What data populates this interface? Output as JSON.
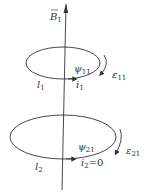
{
  "diagram": {
    "type": "mutual-inductance-coils",
    "colors": {
      "stroke": "#333333",
      "background": "#ffffff"
    },
    "field": {
      "symbol": "B",
      "subscript": "1",
      "overline": true
    },
    "coil1": {
      "length_label": {
        "symbol": "l",
        "subscript": "1"
      },
      "current_label": {
        "symbol": "i",
        "subscript": "1"
      },
      "flux_label": {
        "symbol": "ψ",
        "subscript": "11"
      },
      "emf_label": {
        "symbol": "ε",
        "subscript": "11"
      }
    },
    "coil2": {
      "length_label": {
        "symbol": "l",
        "subscript": "2"
      },
      "current_label": {
        "symbol": "i",
        "subscript": "2",
        "suffix": "=0"
      },
      "flux_label": {
        "symbol": "ψ",
        "subscript": "21"
      },
      "emf_label": {
        "symbol": "ε",
        "subscript": "21"
      }
    }
  }
}
